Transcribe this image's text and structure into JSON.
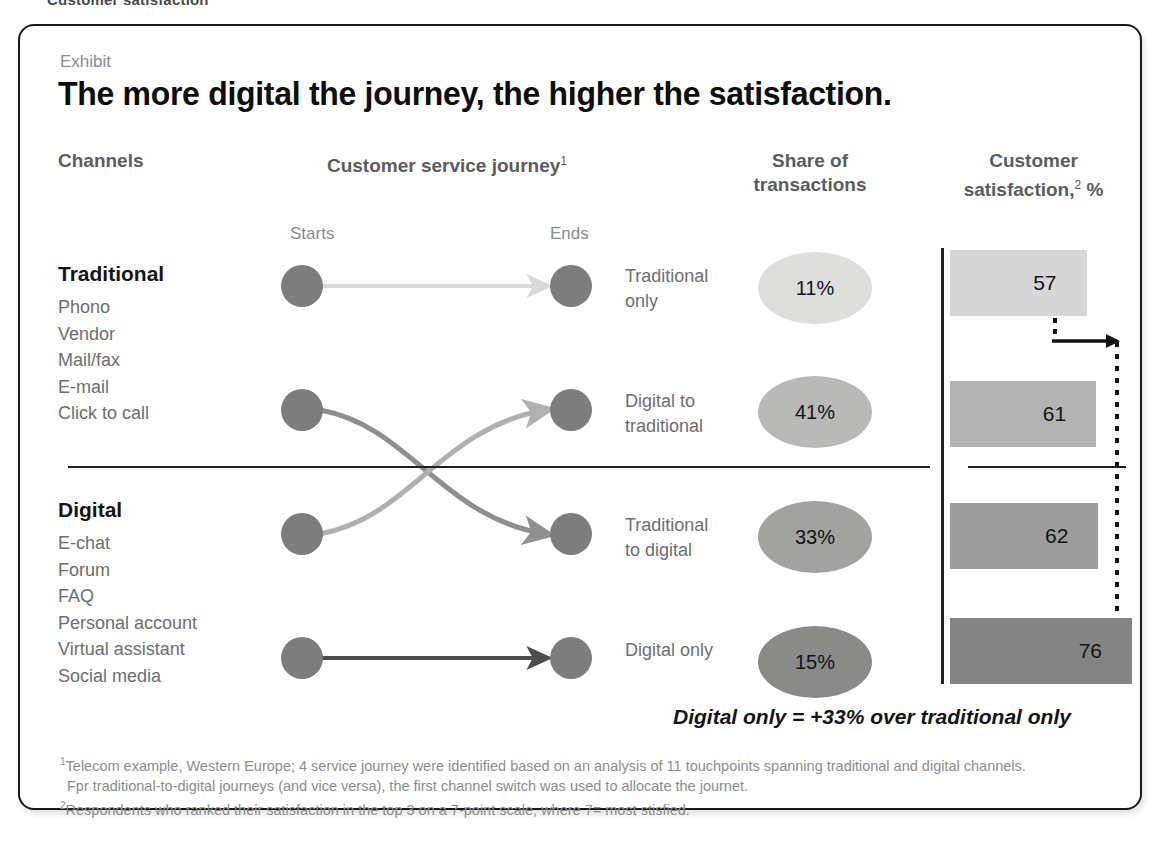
{
  "page": {
    "crumb": "Customer satisfaction"
  },
  "card": {
    "exhibit_label": "Exhibit",
    "title": "The more digital the journey, the higher the satisfaction."
  },
  "headers": {
    "channels": "Channels",
    "journey": "Customer service journey",
    "journey_sup": "1",
    "share": "Share of\ntransactions",
    "share_line1": "Share of",
    "share_line2": "transactions",
    "csat_line1": "Customer",
    "csat_line2": "satisfaction,",
    "csat_sup": "2",
    "csat_unit": " %",
    "starts": "Starts",
    "ends": "Ends"
  },
  "channels": {
    "groups": [
      {
        "title": "Traditional",
        "items": [
          "Phono",
          "Vendor",
          "Mail/fax",
          "E-mail",
          "Click to call"
        ]
      },
      {
        "title": "Digital",
        "items": [
          "E-chat",
          "Forum",
          "FAQ",
          "Personal account",
          "Virtual assistant",
          "Social media"
        ]
      }
    ]
  },
  "caption": "Digital only = +33% over traditional only",
  "footnotes": {
    "line1_sup": "1",
    "line1": "Telecom example, Western Europe; 4 service journey were identified based on an analysis of 11 touchpoints spanning traditional and digital channels.",
    "line2": "Fpr traditional-to-digital journeys (and vice versa), the first channel switch was used to allocate the journet.",
    "line3_sup": "2",
    "line3": "Respondents who ranked their satisfaction in the top 3 on a 7-point scale, where 7= most stisfied."
  },
  "colors": {
    "dot": "#7d7d7d",
    "bar_light": "#d7d7d7",
    "bar_mid_light": "#b3b3b3",
    "bar_mid": "#9c9c9c",
    "bar_dark": "#848484",
    "ellipse_light": "#dededc",
    "ellipse_mid_light": "#b9b9b7",
    "ellipse_mid": "#a2a2a0",
    "ellipse_dark": "#8a8a88",
    "arrow_light": "#d9d9d9",
    "arrow_mid_light": "#b0b0b0",
    "arrow_mid": "#8f8f8f",
    "arrow_dark": "#4d4d4d",
    "rule": "#1f1f1f",
    "text_muted": "#6e6e6e",
    "text_head": "#5c5c5c"
  },
  "chart_data": {
    "type": "bar",
    "title": "The more digital the journey, the higher the satisfaction.",
    "xlabel": "",
    "ylabel": "Customer satisfaction, %",
    "orientation": "horizontal",
    "categories": [
      "Traditional only",
      "Digital to traditional",
      "Traditional to digital",
      "Digital only"
    ],
    "values": [
      57,
      61,
      62,
      76
    ],
    "value_labels": [
      "57",
      "61",
      "62",
      "76"
    ],
    "xlim": [
      0,
      80
    ],
    "grid": false,
    "legend": "none",
    "bar_colors": [
      "#d7d7d7",
      "#b3b3b3",
      "#9c9c9c",
      "#848484"
    ],
    "share_of_transactions": {
      "type": "table",
      "categories": [
        "Traditional only",
        "Digital to traditional",
        "Traditional to digital",
        "Digital only"
      ],
      "values": [
        11,
        41,
        33,
        15
      ],
      "labels": [
        "11%",
        "41%",
        "33%",
        "15%"
      ]
    },
    "journeys": [
      {
        "label_line1": "Traditional",
        "label_line2": "only",
        "start": "traditional",
        "end": "traditional"
      },
      {
        "label_line1": "Digital to",
        "label_line2": "traditional",
        "start": "digital",
        "end": "traditional"
      },
      {
        "label_line1": "Traditional",
        "label_line2": "to digital",
        "start": "traditional",
        "end": "digital"
      },
      {
        "label_line1": "Digital only",
        "label_line2": "",
        "start": "digital",
        "end": "digital"
      }
    ],
    "annotation": "Digital only = +33% over traditional only"
  }
}
